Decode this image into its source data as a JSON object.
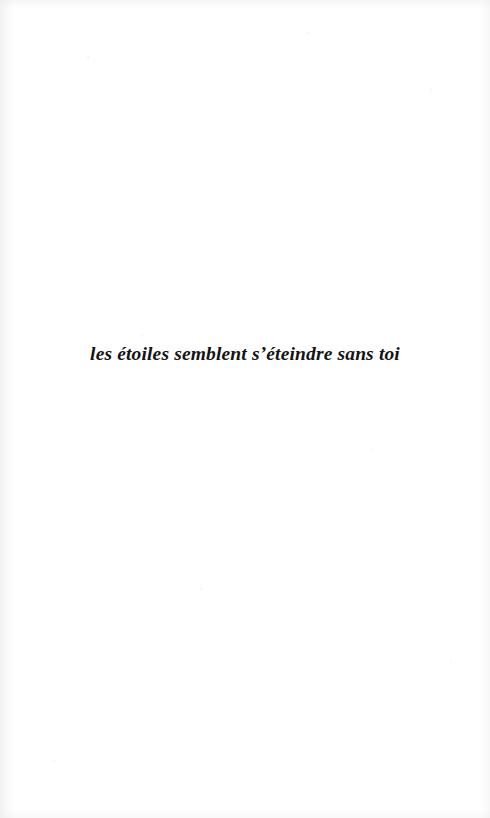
{
  "page": {
    "background_color": "#ffffff",
    "width": 490,
    "height": 818
  },
  "body": {
    "lines": [
      {
        "text": "les étoiles semblent s’éteindre sans toi",
        "style": "bold-italic-serif",
        "align": "center",
        "color": "#141414"
      }
    ]
  },
  "header": {
    "text": ""
  },
  "footer": {
    "page_number": ""
  }
}
